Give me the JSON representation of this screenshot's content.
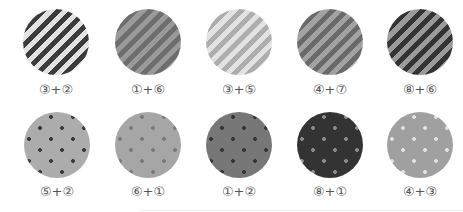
{
  "swatches": [
    {
      "label": "③+②",
      "pattern": "stripes",
      "color_a": "#e2e2e2",
      "color_b": "#3c3c3c"
    },
    {
      "label": "①+⑥",
      "pattern": "stripes",
      "color_a": "#9a9a9a",
      "color_b": "#6e6e6e"
    },
    {
      "label": "③+⑤",
      "pattern": "stripes",
      "color_a": "#e2e2e2",
      "color_b": "#adadad"
    },
    {
      "label": "④+⑦",
      "pattern": "stripes",
      "color_a": "#a2a2a2",
      "color_b": "#6a6a6a"
    },
    {
      "label": "⑧+⑥",
      "pattern": "stripes",
      "color_a": "#9a9a9a",
      "color_b": "#333333"
    },
    {
      "label": "⑤+②",
      "pattern": "dots",
      "color_a": "#acacac",
      "color_b": "#3a3a3a"
    },
    {
      "label": "⑥+①",
      "pattern": "dots",
      "color_a": "#a6a6a6",
      "color_b": "#7a7a7a"
    },
    {
      "label": "①+②",
      "pattern": "dots",
      "color_a": "#777777",
      "color_b": "#353535"
    },
    {
      "label": "⑧+①",
      "pattern": "dots",
      "color_a": "#333333",
      "color_b": "#8a8a8a"
    },
    {
      "label": "④+③",
      "pattern": "dots",
      "color_a": "#a0a0a0",
      "color_b": "#e0e0e0"
    }
  ]
}
